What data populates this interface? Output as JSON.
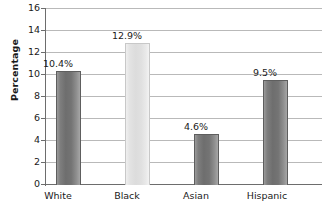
{
  "chart_data": {
    "type": "bar",
    "title": "",
    "xlabel": "",
    "ylabel": "Percentage",
    "categories": [
      "White",
      "Black",
      "Asian",
      "Hispanic"
    ],
    "values": [
      10.4,
      12.9,
      4.6,
      9.5
    ],
    "value_labels": [
      "10.4%",
      "12.9%",
      "4.6%",
      "9.5%"
    ],
    "ylim": [
      0,
      16
    ],
    "yticks": [
      0,
      2,
      4,
      6,
      8,
      10,
      12,
      14,
      16
    ],
    "ytick_labels": [
      "0",
      "2",
      "4",
      "6",
      "8",
      "10",
      "12",
      "14",
      "16"
    ],
    "grid": true,
    "legend": false,
    "bar_colors": [
      "#747474",
      "#dcdcdc",
      "#747474",
      "#747474"
    ],
    "axis_color": "#6d6d6d",
    "gridline_color": "#b9b9b9"
  }
}
